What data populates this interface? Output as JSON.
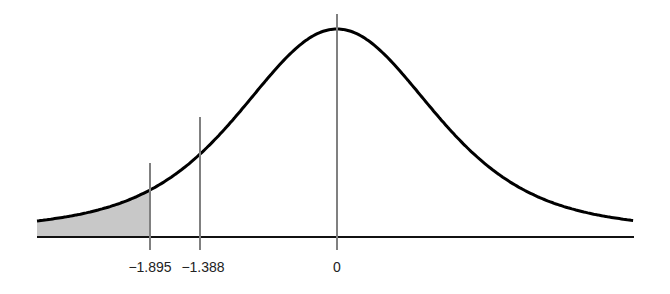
{
  "chart_data": {
    "type": "area",
    "title": "",
    "xlabel": "",
    "ylabel": "",
    "x_range": [
      -3.04,
      3.01
    ],
    "markers": [
      {
        "label": "−1.895",
        "value": -1.895
      },
      {
        "label": "−1.388",
        "value": -1.388
      },
      {
        "label": "0",
        "value": 0
      }
    ],
    "shaded_region": {
      "from": -3.04,
      "to": -1.895
    },
    "grid": false,
    "legend": null
  },
  "colors": {
    "curve": "#000000",
    "axis": "#111111",
    "marker_line": "#808080",
    "shade": "#c8c8c8"
  },
  "labels": {
    "tick_1": "−1.895",
    "tick_2": "−1.388",
    "tick_3": "0"
  }
}
